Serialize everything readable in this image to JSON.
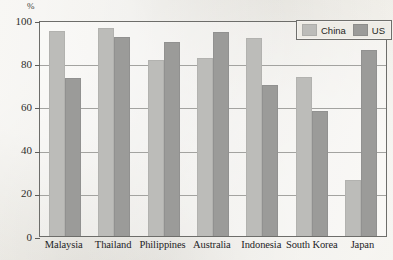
{
  "chart_data": {
    "type": "bar",
    "title": "",
    "subtitle": "",
    "xlabel": "",
    "ylabel": "%",
    "ylim": [
      0,
      100
    ],
    "grid": true,
    "legend_position": "top-right",
    "categories": [
      "Malaysia",
      "Thailand",
      "Philippines",
      "Australia",
      "Indonesia",
      "South Korea",
      "Japan"
    ],
    "yticks": [
      0,
      20,
      40,
      60,
      80,
      100
    ],
    "ytick_labels": [
      "0",
      "20",
      "40",
      "60",
      "80",
      "100"
    ],
    "series": [
      {
        "name": "China",
        "color": "#bcbcb9",
        "values": [
          95,
          96.5,
          81.5,
          82.5,
          91.5,
          73.5,
          26
        ]
      },
      {
        "name": "US",
        "color": "#9b9b99",
        "values": [
          73,
          92,
          90,
          94.5,
          70,
          58,
          86
        ]
      }
    ]
  },
  "axis": {
    "unit_label": "%"
  },
  "legend": {
    "items": [
      {
        "label": "China",
        "swatch": "china"
      },
      {
        "label": "US",
        "swatch": "us"
      }
    ]
  },
  "colors": {
    "china_bar": "#bcbcb9",
    "us_bar": "#9b9b99",
    "background": "#eceae4",
    "axis": "#6d6d6a",
    "gridline": "#a3a3a0",
    "text": "#23231f"
  }
}
